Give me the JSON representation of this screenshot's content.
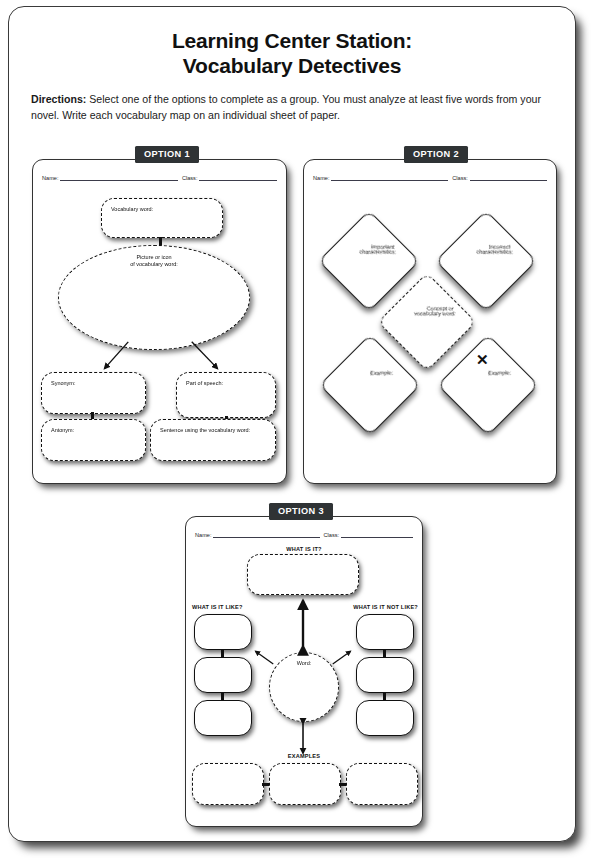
{
  "header": {
    "title_line1": "Learning Center Station:",
    "title_line2": "Vocabulary Detectives",
    "directions_label": "Directions:",
    "directions_text": " Select one of the options to complete as a group. You must analyze at least five words from your novel. Write each vocabulary map on an individual sheet of paper."
  },
  "common": {
    "name_label": "Name:",
    "class_label": "Class:"
  },
  "option1": {
    "badge": "OPTION 1",
    "vocabulary_word": "Vocabulary word:",
    "picture_line1": "Picture or icon",
    "picture_line2": "of vocabulary word:",
    "synonym": "Synonym:",
    "part_of_speech": "Part of speech:",
    "antonym": "Antonym:",
    "sentence": "Sentence using the vocabulary word:"
  },
  "option2": {
    "badge": "OPTION 2",
    "important_line1": "Important",
    "important_line2": "characteristics:",
    "incorrect_line1": "Incorrect",
    "incorrect_line2": "characteristics:",
    "concept_line1": "Concept or",
    "concept_line2": "vocabulary word:",
    "example_left": "Example:",
    "example_right": "Example:",
    "artifact_mark": "✕"
  },
  "option3": {
    "badge": "OPTION 3",
    "what_is_it": "WHAT IS IT?",
    "what_is_it_like": "WHAT IS IT LIKE?",
    "what_is_it_not_like": "WHAT IS IT NOT LIKE?",
    "word": "Word:",
    "examples": "EXAMPLES"
  },
  "colors": {
    "badge_background": "#2f3335",
    "badge_text": "#ffffff",
    "ink": "#111111",
    "paper": "#ffffff"
  }
}
